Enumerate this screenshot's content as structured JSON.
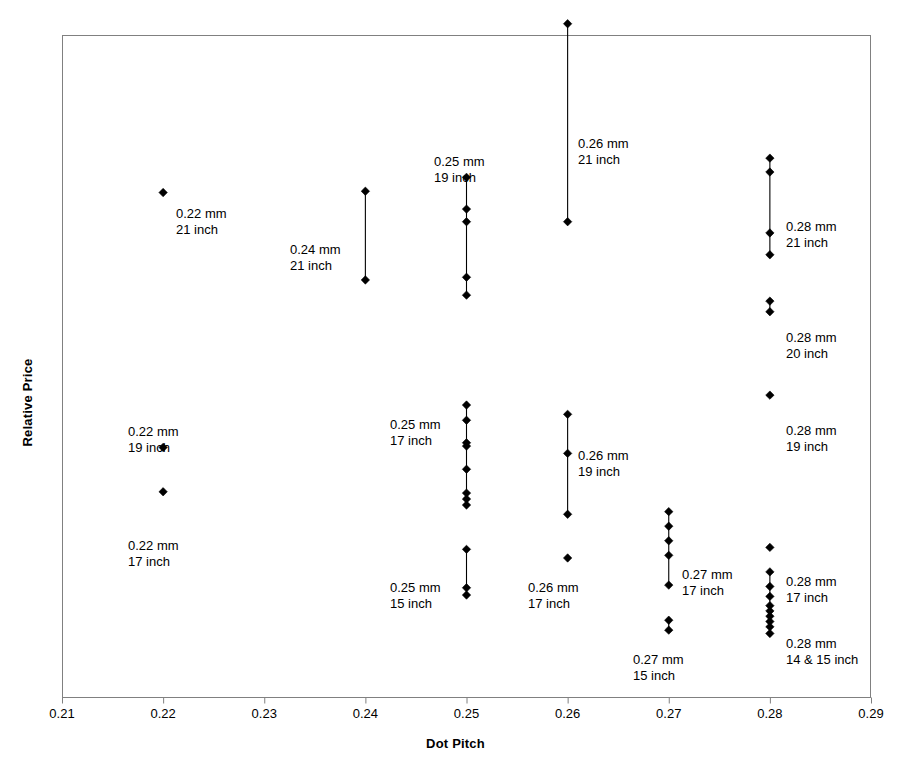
{
  "chart_data": {
    "type": "scatter",
    "title": "",
    "xlabel": "Dot Pitch",
    "ylabel": "Relative Price",
    "xlim": [
      0.21,
      0.29
    ],
    "ylim": [
      0,
      100
    ],
    "grid": false,
    "legend": "none",
    "xticks": [
      "0.21",
      "0.22",
      "0.23",
      "0.24",
      "0.25",
      "0.26",
      "0.27",
      "0.28",
      "0.29"
    ],
    "xtick_values": [
      0.21,
      0.22,
      0.23,
      0.24,
      0.25,
      0.26,
      0.27,
      0.28,
      0.29
    ],
    "ytick_labels": [],
    "marker": "diamond",
    "marker_color": "#000000",
    "connector_color": "#000000",
    "note": "Vertical connector line drawn through each group's point range; relative price axis is unlabeled.",
    "groups": [
      {
        "name": "0.22 mm 21 inch",
        "dot_pitch": 0.22,
        "size_inch": "21",
        "label_lines": [
          "0.22 mm",
          "21 inch"
        ],
        "label_x": 176,
        "label_y": 206,
        "label_align": "start",
        "connector": false,
        "prices": [
          76.2
        ]
      },
      {
        "name": "0.22 mm 19 inch",
        "dot_pitch": 0.22,
        "size_inch": "19",
        "label_lines": [
          "0.22 mm",
          "19 inch"
        ],
        "label_x": 128,
        "label_y": 424,
        "label_align": "start",
        "connector": false,
        "prices": [
          37.7
        ]
      },
      {
        "name": "0.22 mm 17 inch",
        "dot_pitch": 0.22,
        "size_inch": "17",
        "label_lines": [
          "0.22 mm",
          "17 inch"
        ],
        "label_x": 128,
        "label_y": 538,
        "label_align": "start",
        "connector": false,
        "prices": [
          31.0
        ]
      },
      {
        "name": "0.24 mm 21 inch",
        "dot_pitch": 0.24,
        "size_inch": "21",
        "label_lines": [
          "0.24 mm",
          "21 inch"
        ],
        "label_x": 290,
        "label_y": 242,
        "label_align": "start",
        "connector": true,
        "prices": [
          76.4,
          63.0
        ]
      },
      {
        "name": "0.25 mm 19 inch",
        "dot_pitch": 0.25,
        "size_inch": "19",
        "label_lines": [
          "0.25 mm",
          "19 inch"
        ],
        "label_x": 434,
        "label_y": 154,
        "label_align": "start",
        "connector": true,
        "prices": [
          78.5,
          73.7,
          71.8,
          63.4,
          60.7
        ]
      },
      {
        "name": "0.25 mm 17 inch",
        "dot_pitch": 0.25,
        "size_inch": "17",
        "label_lines": [
          "0.25 mm",
          "17 inch"
        ],
        "label_x": 390,
        "label_y": 417,
        "label_align": "start",
        "connector": true,
        "prices": [
          44.1,
          41.8,
          38.4,
          37.9,
          34.4,
          30.8,
          29.9,
          29.0
        ]
      },
      {
        "name": "0.25 mm 15 inch",
        "dot_pitch": 0.25,
        "size_inch": "15",
        "label_lines": [
          "0.25 mm",
          "15 inch"
        ],
        "label_x": 390,
        "label_y": 580,
        "label_align": "start",
        "connector": true,
        "prices": [
          22.3,
          16.5,
          15.4
        ]
      },
      {
        "name": "0.26 mm 21 inch",
        "dot_pitch": 0.26,
        "size_inch": "21",
        "label_lines": [
          "0.26 mm",
          "21 inch"
        ],
        "label_x": 578,
        "label_y": 136,
        "label_align": "start",
        "connector": true,
        "prices": [
          101.7,
          71.8
        ]
      },
      {
        "name": "0.26 mm 19 inch",
        "dot_pitch": 0.26,
        "size_inch": "19",
        "label_lines": [
          "0.26 mm",
          "19 inch"
        ],
        "label_x": 578,
        "label_y": 448,
        "label_align": "start",
        "connector": true,
        "prices": [
          42.7,
          36.8,
          27.6
        ]
      },
      {
        "name": "0.26 mm 17 inch",
        "dot_pitch": 0.26,
        "size_inch": "17",
        "label_lines": [
          "0.26 mm",
          "17 inch"
        ],
        "label_x": 528,
        "label_y": 580,
        "label_align": "start",
        "connector": false,
        "prices": [
          21.0
        ]
      },
      {
        "name": "0.27 mm 17 inch",
        "dot_pitch": 0.27,
        "size_inch": "17",
        "label_lines": [
          "0.27 mm",
          "17 inch"
        ],
        "label_x": 682,
        "label_y": 567,
        "label_align": "start",
        "connector": true,
        "prices": [
          28.0,
          25.8,
          23.6,
          21.4,
          16.9
        ]
      },
      {
        "name": "0.27 mm 15 inch",
        "dot_pitch": 0.27,
        "size_inch": "15",
        "label_lines": [
          "0.27 mm",
          "15 inch"
        ],
        "label_x": 633,
        "label_y": 652,
        "label_align": "start",
        "connector": true,
        "prices": [
          11.6,
          10.1
        ]
      },
      {
        "name": "0.28 mm 21 inch",
        "dot_pitch": 0.28,
        "size_inch": "21",
        "label_lines": [
          "0.28 mm",
          "21 inch"
        ],
        "label_x": 786,
        "label_y": 219,
        "label_align": "start",
        "connector": true,
        "prices": [
          81.4,
          79.3,
          70.1,
          66.8
        ]
      },
      {
        "name": "0.28 mm 20 inch",
        "dot_pitch": 0.28,
        "size_inch": "20",
        "label_lines": [
          "0.28 mm",
          "20 inch"
        ],
        "label_x": 786,
        "label_y": 330,
        "label_align": "start",
        "connector": true,
        "prices": [
          59.8,
          58.2
        ]
      },
      {
        "name": "0.28 mm 19 inch",
        "dot_pitch": 0.28,
        "size_inch": "19",
        "label_lines": [
          "0.28 mm",
          "19 inch"
        ],
        "label_x": 786,
        "label_y": 423,
        "label_align": "start",
        "connector": false,
        "prices": [
          45.6
        ]
      },
      {
        "name": "0.28 mm 17 inch",
        "dot_pitch": 0.28,
        "size_inch": "17",
        "label_lines": [
          "0.28 mm",
          "17 inch"
        ],
        "label_x": 786,
        "label_y": 574,
        "label_align": "start",
        "connector": false,
        "prices": [
          22.6
        ]
      },
      {
        "name": "0.28 mm 14 & 15 inch",
        "dot_pitch": 0.28,
        "size_inch": "14 & 15",
        "label_lines": [
          "0.28 mm",
          "14 & 15 inch"
        ],
        "label_x": 786,
        "label_y": 636,
        "label_align": "start",
        "connector": true,
        "prices": [
          18.9,
          16.7,
          15.2,
          13.8,
          13.0,
          12.2,
          11.4,
          10.6,
          9.6
        ]
      }
    ]
  },
  "axes": {
    "x_title": "Dot Pitch",
    "y_title": "Relative Price"
  }
}
